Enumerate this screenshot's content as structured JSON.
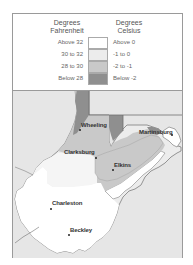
{
  "legend": {
    "fahrenheit_header": "Degrees Fahrenheit",
    "celsius_header": "Degrees Celsius",
    "rows": [
      {
        "fahrenheit": "Above 32",
        "celsius": "Above 0",
        "color": "#ffffff"
      },
      {
        "fahrenheit": "30 to 32",
        "celsius": "-1 to 0",
        "color": "#ececec"
      },
      {
        "fahrenheit": "28 to 30",
        "celsius": "-2 to -1",
        "color": "#c9c9c9"
      },
      {
        "fahrenheit": "Below 28",
        "celsius": "Below -2",
        "color": "#8f8f8f"
      }
    ]
  },
  "map": {
    "outside_color": "#e6e6e6",
    "border_color": "#7a7a7a",
    "cities": [
      {
        "name": "Wheeling"
      },
      {
        "name": "Martinsburg"
      },
      {
        "name": "Clarksburg"
      },
      {
        "name": "Elkins"
      },
      {
        "name": "Charleston"
      },
      {
        "name": "Beckley"
      }
    ]
  }
}
